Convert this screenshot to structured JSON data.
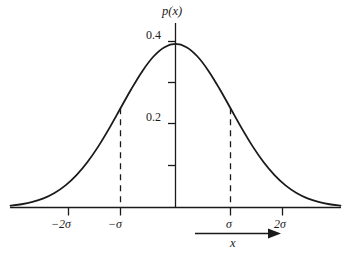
{
  "figure": {
    "name": "gaussian-normal-distribution-plot",
    "background_color": "#ffffff",
    "ink_color": "#1a1a1a",
    "width": 350,
    "height": 255
  },
  "chart_data": {
    "type": "line",
    "title": "",
    "subtitle": "",
    "xlabel": "x",
    "ylabel": "p(x)",
    "curve_name": "gaussian-probability-density",
    "distribution": "normal",
    "mean": 0,
    "sigma": 1,
    "peak_value": 0.4,
    "grid": false,
    "legend": null,
    "xlim": [
      -3.0,
      3.0
    ],
    "ylim": [
      0.0,
      0.44
    ],
    "x_axis": {
      "label": "x",
      "tick_values": [
        -2,
        -1,
        0,
        1,
        2
      ],
      "tick_labels": [
        "−2σ",
        "−σ",
        "",
        "σ",
        "2σ"
      ],
      "unit": "sigma",
      "arrow_label": "x",
      "arrow_direction": "right"
    },
    "y_axis": {
      "label": "p(x)",
      "tick_values": [
        0.1,
        0.2,
        0.3,
        0.4
      ],
      "tick_labels": [
        "",
        "0.2",
        "",
        "0.4"
      ],
      "labeled_ticks": [
        {
          "value": 0.4,
          "text": "0.4"
        },
        {
          "value": 0.2,
          "text": "0.2"
        }
      ]
    },
    "annotations": [
      {
        "name": "dashed-drop-line-minus-sigma",
        "style": "dashed-vertical",
        "x": -1,
        "y_top": 0.242,
        "y_bottom": 0
      },
      {
        "name": "dashed-drop-line-plus-sigma",
        "style": "dashed-vertical",
        "x": 1,
        "y_top": 0.242,
        "y_bottom": 0
      }
    ],
    "x": [
      -3.0,
      -2.8,
      -2.6,
      -2.4,
      -2.2,
      -2.0,
      -1.8,
      -1.6,
      -1.4,
      -1.2,
      -1.0,
      -0.8,
      -0.6,
      -0.4,
      -0.2,
      0.0,
      0.2,
      0.4,
      0.6,
      0.8,
      1.0,
      1.2,
      1.4,
      1.6,
      1.8,
      2.0,
      2.2,
      2.4,
      2.6,
      2.8,
      3.0
    ],
    "values": [
      0.0044,
      0.0079,
      0.0136,
      0.0224,
      0.0355,
      0.054,
      0.079,
      0.1109,
      0.1497,
      0.1942,
      0.242,
      0.2897,
      0.3332,
      0.3683,
      0.391,
      0.3989,
      0.391,
      0.3683,
      0.3332,
      0.2897,
      0.242,
      0.1942,
      0.1497,
      0.1109,
      0.079,
      0.054,
      0.0355,
      0.0224,
      0.0136,
      0.0079,
      0.0044
    ]
  },
  "labels": {
    "y_axis_title": "p(x)",
    "x_axis_title": "x",
    "y_tick_04": "0.4",
    "y_tick_02": "0.2",
    "x_tick_minus_2sigma": "−2σ",
    "x_tick_minus_sigma": "−σ",
    "x_tick_plus_sigma": "σ",
    "x_tick_plus_2sigma": "2σ"
  }
}
